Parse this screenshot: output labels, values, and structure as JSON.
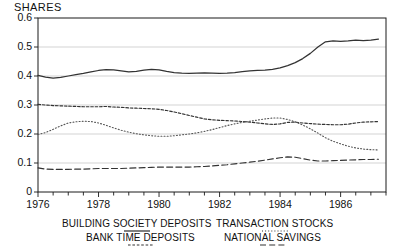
{
  "chart_data": {
    "type": "line",
    "title": "SHARES",
    "xlabel": "",
    "ylabel": "",
    "ylim": [
      0,
      0.6
    ],
    "xlim": [
      1976,
      1987.5
    ],
    "grid": true,
    "legend_position": "below-axis",
    "ytick_labels": [
      "0.6",
      "0.5",
      "0.4",
      "0.3",
      "0.2",
      "0.1",
      "0"
    ],
    "ytick_values": [
      0.6,
      0.5,
      0.4,
      0.3,
      0.2,
      0.1,
      0
    ],
    "xtick_labels": [
      "1976",
      "1978",
      "1980",
      "1982",
      "1984",
      "1986"
    ],
    "xtick_values": [
      1976,
      1978,
      1980,
      1982,
      1984,
      1986
    ],
    "minor_tick_interval": 0.5,
    "x": [
      1976.0,
      1976.25,
      1976.5,
      1976.75,
      1977.0,
      1977.25,
      1977.5,
      1977.75,
      1978.0,
      1978.25,
      1978.5,
      1978.75,
      1979.0,
      1979.25,
      1979.5,
      1979.75,
      1980.0,
      1980.25,
      1980.5,
      1980.75,
      1981.0,
      1981.25,
      1981.5,
      1981.75,
      1982.0,
      1982.25,
      1982.5,
      1982.75,
      1983.0,
      1983.25,
      1983.5,
      1983.75,
      1984.0,
      1984.25,
      1984.5,
      1984.75,
      1985.0,
      1985.25,
      1985.5,
      1985.75,
      1986.0,
      1986.25,
      1986.5,
      1986.75,
      1987.0,
      1987.25
    ],
    "series": [
      {
        "name": "BUILDING SOCIETY DEPOSITS",
        "style": "solid",
        "color": "#333333",
        "values": [
          0.402,
          0.396,
          0.393,
          0.395,
          0.4,
          0.405,
          0.409,
          0.414,
          0.419,
          0.422,
          0.421,
          0.418,
          0.414,
          0.416,
          0.42,
          0.423,
          0.421,
          0.416,
          0.412,
          0.41,
          0.409,
          0.41,
          0.411,
          0.41,
          0.409,
          0.41,
          0.412,
          0.415,
          0.418,
          0.419,
          0.42,
          0.423,
          0.428,
          0.436,
          0.446,
          0.46,
          0.478,
          0.5,
          0.518,
          0.521,
          0.519,
          0.521,
          0.524,
          0.522,
          0.524,
          0.527
        ]
      },
      {
        "name": "BANK TIME DEPOSITS",
        "style": "dashed-fine",
        "color": "#333333",
        "values": [
          0.302,
          0.3,
          0.298,
          0.297,
          0.296,
          0.295,
          0.294,
          0.294,
          0.294,
          0.295,
          0.293,
          0.292,
          0.29,
          0.289,
          0.288,
          0.287,
          0.285,
          0.281,
          0.276,
          0.27,
          0.264,
          0.258,
          0.252,
          0.249,
          0.247,
          0.246,
          0.245,
          0.243,
          0.241,
          0.238,
          0.235,
          0.233,
          0.235,
          0.24,
          0.241,
          0.238,
          0.236,
          0.234,
          0.233,
          0.232,
          0.232,
          0.234,
          0.238,
          0.241,
          0.242,
          0.243
        ]
      },
      {
        "name": "TRANSACTION STOCKS",
        "style": "dotted",
        "color": "#555555",
        "values": [
          0.198,
          0.205,
          0.216,
          0.228,
          0.238,
          0.242,
          0.244,
          0.243,
          0.238,
          0.23,
          0.221,
          0.213,
          0.206,
          0.201,
          0.197,
          0.194,
          0.192,
          0.192,
          0.194,
          0.197,
          0.2,
          0.204,
          0.209,
          0.215,
          0.222,
          0.229,
          0.235,
          0.24,
          0.244,
          0.248,
          0.252,
          0.255,
          0.255,
          0.25,
          0.242,
          0.231,
          0.218,
          0.203,
          0.187,
          0.175,
          0.166,
          0.158,
          0.152,
          0.148,
          0.146,
          0.145
        ]
      },
      {
        "name": "NATIONAL SAVINGS",
        "style": "dashed-long",
        "color": "#333333",
        "values": [
          0.083,
          0.079,
          0.078,
          0.078,
          0.078,
          0.079,
          0.079,
          0.08,
          0.081,
          0.081,
          0.081,
          0.081,
          0.082,
          0.083,
          0.084,
          0.085,
          0.086,
          0.086,
          0.086,
          0.086,
          0.086,
          0.087,
          0.088,
          0.09,
          0.092,
          0.094,
          0.097,
          0.1,
          0.103,
          0.106,
          0.11,
          0.114,
          0.118,
          0.121,
          0.12,
          0.115,
          0.11,
          0.107,
          0.107,
          0.108,
          0.109,
          0.11,
          0.111,
          0.112,
          0.112,
          0.113
        ]
      }
    ],
    "legend": [
      {
        "label": "BUILDING SOCIETY DEPOSITS",
        "style": "solid"
      },
      {
        "label": "TRANSACTION STOCKS",
        "style": "dotted"
      },
      {
        "label": "BANK TIME DEPOSITS",
        "style": "dashed-fine"
      },
      {
        "label": "NATIONAL SAVINGS",
        "style": "dashed-long"
      }
    ],
    "colors": {
      "axis": "#1a1a1a",
      "grid": "#c8c8c8",
      "background": "#ffffff",
      "text": "#111111"
    }
  }
}
